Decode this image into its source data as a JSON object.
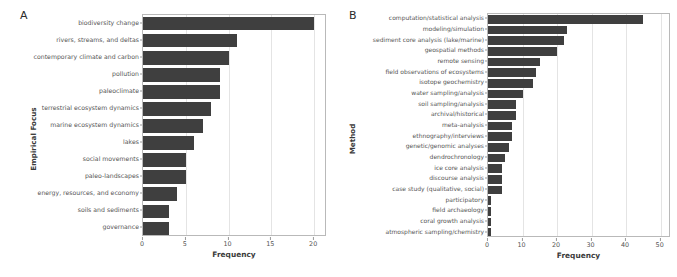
{
  "figure": {
    "panels": [
      {
        "letter": "A",
        "ylabel": "Empirical Focus",
        "xlabel": "Frequency"
      },
      {
        "letter": "B",
        "ylabel": "Method",
        "xlabel": "Frequency"
      }
    ]
  },
  "chart_data": [
    {
      "type": "bar",
      "orientation": "horizontal",
      "panel": "A",
      "title": "",
      "xlabel": "Frequency",
      "ylabel": "Empirical Focus",
      "xlim": [
        0,
        21.5
      ],
      "xticks": [
        0,
        5,
        10,
        15,
        20
      ],
      "grid": true,
      "legend": null,
      "bar_color": "#3f3f3f",
      "categories": [
        "biodiversity change",
        "rivers, streams, and deltas",
        "contemporary climate and carbon",
        "pollution",
        "paleoclimate",
        "terrestrial ecosystem dynamics",
        "marine ecosystem dynamics",
        "lakes",
        "social movements",
        "paleo-landscapes",
        "energy, resources, and economy",
        "soils and sediments",
        "governance"
      ],
      "values": [
        20,
        11,
        10,
        9,
        9,
        8,
        7,
        6,
        5,
        5,
        4,
        3,
        3
      ]
    },
    {
      "type": "bar",
      "orientation": "horizontal",
      "panel": "B",
      "title": "",
      "xlabel": "Frequency",
      "ylabel": "Method",
      "xlim": [
        0,
        53
      ],
      "xticks": [
        0,
        10,
        20,
        30,
        40,
        50
      ],
      "grid": true,
      "legend": null,
      "bar_color": "#3f3f3f",
      "categories": [
        "computation/statistical analysis",
        "modeling/simulation",
        "sediment core analysis (lake/marine)",
        "geospatial methods",
        "remote sensing",
        "field observations of ecosystems",
        "isotope geochemistry",
        "water sampling/analysis",
        "soil sampling/analysis",
        "archival/historical",
        "meta-analysis",
        "ethnography/interviews",
        "genetic/genomic analyses",
        "dendrochronology",
        "ice core analysis",
        "discourse analysis",
        "case study (qualitative, social)",
        "participatory",
        "field archaeology",
        "coral growth analysis",
        "atmospheric sampling/chemistry"
      ],
      "values": [
        45,
        23,
        22,
        20,
        15,
        14,
        13,
        10,
        8,
        8,
        7,
        7,
        6,
        5,
        4,
        4,
        4,
        1,
        1,
        1,
        1
      ]
    }
  ]
}
